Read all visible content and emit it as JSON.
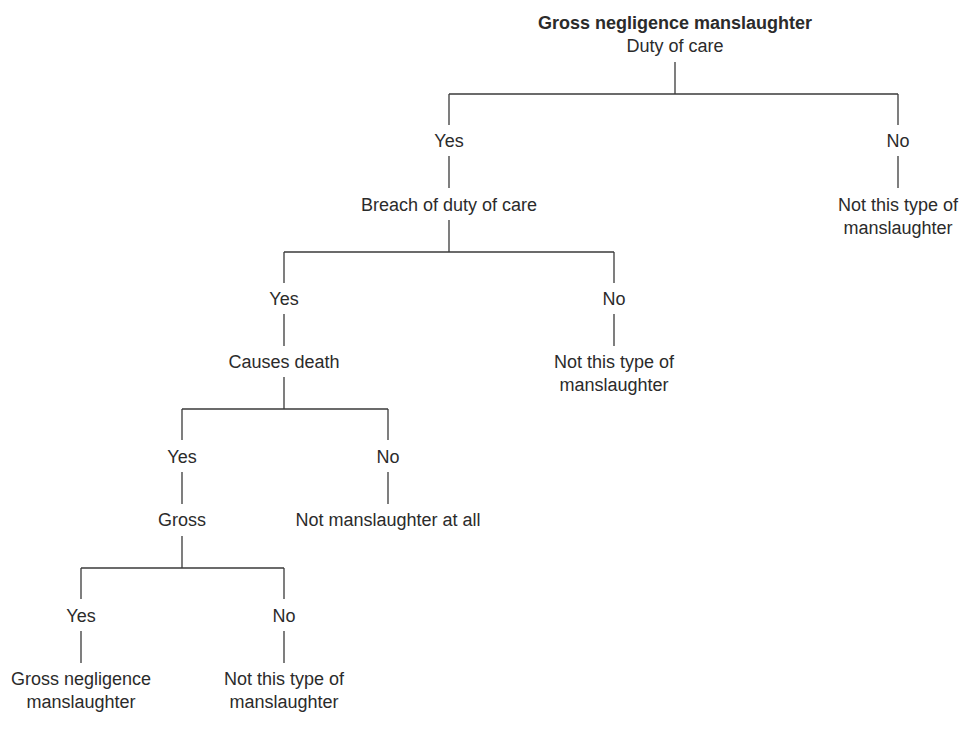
{
  "diagram": {
    "title": "Gross negligence manslaughter",
    "root": "Duty of care",
    "level1": {
      "yes": "Yes",
      "no": "No",
      "yes_node": "Breach of duty of care",
      "no_outcome_line1": "Not this type of",
      "no_outcome_line2": "manslaughter"
    },
    "level2": {
      "yes": "Yes",
      "no": "No",
      "yes_node": "Causes death",
      "no_outcome_line1": "Not this type of",
      "no_outcome_line2": "manslaughter"
    },
    "level3": {
      "yes": "Yes",
      "no": "No",
      "yes_node": "Gross",
      "no_outcome": "Not manslaughter at all"
    },
    "level4": {
      "yes": "Yes",
      "no": "No",
      "yes_outcome_line1": "Gross negligence",
      "yes_outcome_line2": "manslaughter",
      "no_outcome_line1": "Not this type of",
      "no_outcome_line2": "manslaughter"
    }
  },
  "colors": {
    "text": "#2b2b2b",
    "lines": "#3a3a3a",
    "background": "#ffffff"
  }
}
